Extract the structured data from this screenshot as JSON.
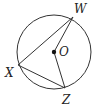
{
  "diagram": {
    "type": "circle-geometry",
    "circle": {
      "center_label": "O",
      "cx": 54,
      "cy": 52,
      "r": 37
    },
    "points": [
      {
        "label": "W",
        "x": 73,
        "y": 17,
        "label_x": 74,
        "label_y": 13
      },
      {
        "label": "X",
        "x": 18,
        "y": 65,
        "label_x": 5,
        "label_y": 77
      },
      {
        "label": "Z",
        "x": 65,
        "y": 88,
        "label_x": 62,
        "label_y": 104
      },
      {
        "label": "O",
        "x": 54,
        "y": 52,
        "label_x": 59,
        "label_y": 56
      }
    ],
    "segments": [
      "XW",
      "XZ",
      "OW",
      "OZ"
    ],
    "stroke_color": "#333333"
  }
}
